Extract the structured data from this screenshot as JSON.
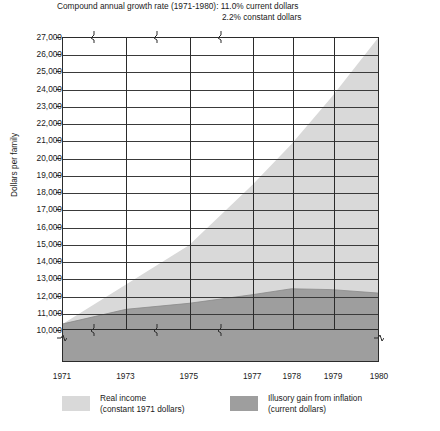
{
  "title": {
    "line1": "Compound annual growth rate (1971-1980):  11.0% current dollars",
    "line2": "2.2% constant dollars"
  },
  "axes": {
    "y_title": "Dollars per family",
    "y_ticks": [
      "27,000",
      "26,000",
      "25,000",
      "24,000",
      "23,000",
      "22,000",
      "21,000",
      "20,000",
      "19,000",
      "18,000",
      "17,000",
      "16,000",
      "15,000",
      "14,000",
      "13,000",
      "12,000",
      "11,000",
      "10,000"
    ],
    "x_ticks": [
      "1971",
      "1973",
      "1975",
      "1977",
      "1978",
      "1979",
      "1980"
    ]
  },
  "legend": {
    "items": [
      {
        "name": "real-income",
        "label_line1": "Real income",
        "label_line2": "(constant 1971 dollars)",
        "color": "#d9d9d9"
      },
      {
        "name": "illusory-gain",
        "label_line1": "Illusory gain from inflation",
        "label_line2": "(current dollars)",
        "color": "#9e9e9e"
      }
    ]
  },
  "colors": {
    "illusory_gain": "#d9d9d9",
    "real_income": "#9e9e9e",
    "axis": "#2b2b2b",
    "grid": "#3a3a3a",
    "background": "#ffffff"
  },
  "chart_data": {
    "type": "area",
    "xlabel": "",
    "ylabel": "Dollars per family",
    "x": [
      1971,
      1973,
      1975,
      1977,
      1978,
      1979,
      1980
    ],
    "xlim": [
      1971,
      1980
    ],
    "ylim": [
      10000,
      27000
    ],
    "y_axis_break_below": 10000,
    "grid": true,
    "legend_position": "bottom",
    "stacked": true,
    "series": [
      {
        "name": "Real income (constant 1971 dollars)",
        "color": "#9e9e9e",
        "values": [
          10300,
          11150,
          11500,
          12000,
          12350,
          12300,
          12100
        ]
      },
      {
        "name": "Total family income (current dollars)",
        "color": "#d9d9d9",
        "values": [
          10300,
          12600,
          14900,
          18400,
          20800,
          23600,
          27000
        ]
      }
    ],
    "annotations": [
      "11.0% current dollars",
      "2.2% constant dollars"
    ]
  }
}
